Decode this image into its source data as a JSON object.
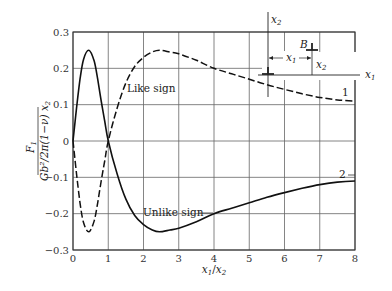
{
  "chart_data": {
    "type": "line",
    "title": "",
    "xlabel": "x1/x2",
    "ylabel": "F1 / (Gb^2 / 2π(1−ν) x2)",
    "xlim": [
      0,
      8
    ],
    "ylim": [
      -0.3,
      0.3
    ],
    "grid": true,
    "x_ticks": [
      "0",
      "1",
      "2",
      "3",
      "4",
      "5",
      "6",
      "7",
      "8"
    ],
    "y_ticks": [
      "0.3",
      "0.2",
      "0.1",
      "0",
      "−0.1",
      "−0.2",
      "−0.3"
    ],
    "series": [
      {
        "name": "1",
        "label": "Like sign",
        "style": "dashed",
        "x": [
          0,
          0.1,
          0.2,
          0.3,
          0.45,
          0.6,
          0.7,
          0.8,
          0.9,
          1,
          1.25,
          1.5,
          1.75,
          2,
          2.25,
          2.45,
          2.75,
          3,
          3.5,
          4,
          4.5,
          5,
          5.5,
          6,
          6.5,
          7,
          7.5,
          8
        ],
        "values": [
          0,
          -0.09,
          -0.17,
          -0.225,
          -0.25,
          -0.22,
          -0.17,
          -0.11,
          -0.055,
          0,
          0.09,
          0.16,
          0.205,
          0.23,
          0.245,
          0.25,
          0.245,
          0.24,
          0.222,
          0.2,
          0.185,
          0.17,
          0.155,
          0.142,
          0.13,
          0.12,
          0.113,
          0.11
        ]
      },
      {
        "name": "2",
        "label": "Unlike sign",
        "style": "solid",
        "x": [
          0,
          0.1,
          0.2,
          0.3,
          0.45,
          0.6,
          0.7,
          0.8,
          0.9,
          1,
          1.25,
          1.5,
          1.75,
          2,
          2.25,
          2.45,
          2.75,
          3,
          3.5,
          4,
          4.5,
          5,
          5.5,
          6,
          6.5,
          7,
          7.5,
          8
        ],
        "values": [
          0,
          0.09,
          0.17,
          0.225,
          0.25,
          0.22,
          0.17,
          0.11,
          0.055,
          0,
          -0.09,
          -0.16,
          -0.205,
          -0.23,
          -0.245,
          -0.25,
          -0.245,
          -0.24,
          -0.222,
          -0.2,
          -0.185,
          -0.17,
          -0.155,
          -0.142,
          -0.13,
          -0.12,
          -0.113,
          -0.11
        ]
      }
    ],
    "annotations": [
      {
        "text": "Like sign",
        "series": "1"
      },
      {
        "text": "Unlike sign",
        "series": "2"
      },
      {
        "text": "1",
        "series": "1"
      },
      {
        "text": "2",
        "series": "2"
      }
    ],
    "inset": {
      "description": "Two edge dislocations; one at origin, B at (x1, x2)",
      "axis_labels": [
        "x1",
        "x2"
      ],
      "point_label": "B",
      "dimension_labels": [
        "x1",
        "x2"
      ]
    }
  },
  "labels": {
    "like_sign": "Like sign",
    "unlike_sign": "Unlike sign",
    "curve1": "1",
    "curve2": "2",
    "ylabel_num": "F",
    "ylabel_num_sub": "1",
    "ylabel_den": "Gb²/2π(1−ν) x",
    "ylabel_den_sub": "2",
    "xlabel_a": "x",
    "xlabel_a_sub": "1",
    "xlabel_slash": "/",
    "xlabel_b": "x",
    "xlabel_b_sub": "2",
    "inset_x1": "x",
    "inset_x1_sub": "1",
    "inset_x2": "x",
    "inset_x2_sub": "2",
    "inset_B": "B",
    "inset_dim_x1": "x",
    "inset_dim_x1_sub": "1",
    "inset_dim_x2": "x",
    "inset_dim_x2_sub": "2"
  },
  "style": {
    "grid_color": "#555555",
    "curve_color": "#111111"
  }
}
